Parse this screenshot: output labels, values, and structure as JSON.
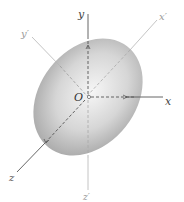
{
  "diagram": {
    "type": "ellipsoid-with-coordinate-axes",
    "colors": {
      "background": "#ffffff",
      "ellipsoid_light": "#f4f4f4",
      "ellipsoid_dark": "#9a9a9a",
      "axis_main": "#555555",
      "axis_primed": "#b0b0b0",
      "label_main": "#444444",
      "label_primed": "#999999"
    },
    "origin": {
      "label": "O",
      "x": 87,
      "y": 97
    },
    "axes": {
      "main": [
        {
          "name": "x",
          "label": "x"
        },
        {
          "name": "y",
          "label": "y"
        },
        {
          "name": "z",
          "label": "z"
        }
      ],
      "primed": [
        {
          "name": "x-prime",
          "label": "x′"
        },
        {
          "name": "y-prime",
          "label": "y′"
        },
        {
          "name": "z-prime",
          "label": "z′"
        }
      ]
    }
  }
}
